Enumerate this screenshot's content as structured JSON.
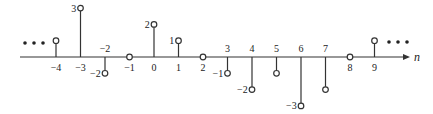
{
  "chart_data": {
    "type": "stem",
    "title": "",
    "xlabel": "n",
    "ylabel": "",
    "x": [
      -4,
      -3,
      -2,
      -1,
      0,
      1,
      2,
      3,
      4,
      5,
      6,
      7,
      8,
      9
    ],
    "values": [
      1,
      3,
      -1,
      0,
      2,
      1,
      0,
      -1,
      -2,
      -1,
      -3,
      -2,
      0,
      1
    ],
    "value_labels": {
      "-3": "3",
      "-2": "-2",
      "0": "2",
      "1": "1",
      "3": "-1",
      "4": "-2",
      "6": "-3"
    },
    "ylim": [
      -3,
      3
    ],
    "continues_left": true,
    "continues_right": true
  },
  "axis": {
    "label": "n",
    "ellipsis_left": "•••",
    "ellipsis_right": "•••"
  },
  "colors": {
    "line": "#333333",
    "marker_fill": "#ffffff",
    "text": "#222222"
  }
}
